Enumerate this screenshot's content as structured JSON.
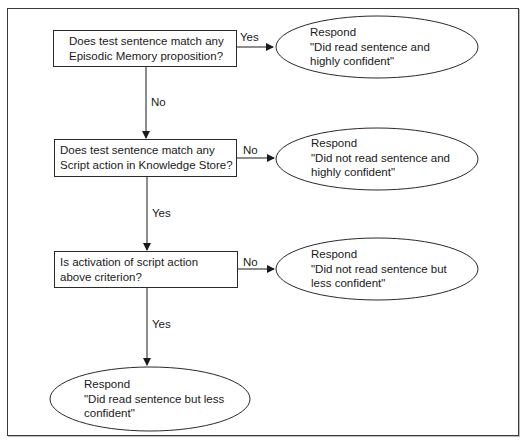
{
  "diagram": {
    "type": "flowchart",
    "decisions": [
      {
        "id": "d1",
        "lines": [
          "Does test sentence match any",
          "Episodic Memory proposition?"
        ]
      },
      {
        "id": "d2",
        "lines": [
          "Does test sentence match any",
          "Script action in Knowledge Store?"
        ]
      },
      {
        "id": "d3",
        "lines": [
          "Is activation of script action",
          "above criterion?"
        ]
      }
    ],
    "responses": [
      {
        "id": "r1",
        "lines": [
          "Respond",
          "\"Did read sentence and",
          "highly confident\""
        ]
      },
      {
        "id": "r2",
        "lines": [
          "Respond",
          "\"Did not read sentence and",
          "highly confident\""
        ]
      },
      {
        "id": "r3",
        "lines": [
          "Respond",
          "\"Did not read sentence but",
          "less confident\""
        ]
      },
      {
        "id": "r4",
        "lines": [
          "Respond",
          "\"Did read sentence but less",
          "confident\""
        ]
      }
    ],
    "edges": [
      {
        "from": "d1",
        "to": "r1",
        "label": "Yes"
      },
      {
        "from": "d1",
        "to": "d2",
        "label": "No"
      },
      {
        "from": "d2",
        "to": "r2",
        "label": "No"
      },
      {
        "from": "d2",
        "to": "d3",
        "label": "Yes"
      },
      {
        "from": "d3",
        "to": "r3",
        "label": "No"
      },
      {
        "from": "d3",
        "to": "r4",
        "label": "Yes"
      }
    ],
    "colors": {
      "stroke": "#2a2a2a",
      "background": "#ffffff",
      "text": "#1a1a1a"
    }
  }
}
